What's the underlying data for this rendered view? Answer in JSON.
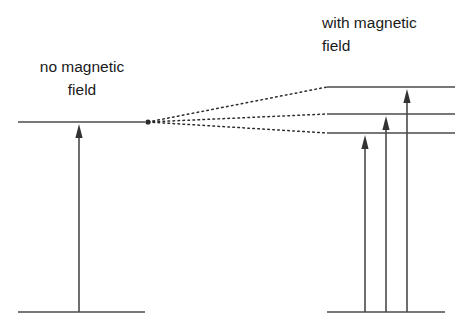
{
  "figure": {
    "background_color": "#ffffff",
    "line_color": "#4a4a4a",
    "dotted_color": "#2b2b2b",
    "text_color": "#1a1a1a",
    "width": 470,
    "height": 326
  },
  "labels": {
    "left": {
      "line1": "no magnetic",
      "line2": "field",
      "x": 82,
      "y1": 72,
      "y2": 95,
      "anchor": "middle"
    },
    "right": {
      "line1": "with magnetic",
      "line2": "field",
      "x": 322,
      "y1": 28,
      "y2": 51,
      "anchor": "start"
    }
  },
  "diagram_data": {
    "type": "energy-level",
    "left_panel": {
      "name": "no-magnetic-field",
      "excited_level": {
        "x1": 18,
        "x2": 145,
        "y": 122
      },
      "ground_level": {
        "x1": 18,
        "x2": 145,
        "y": 312
      },
      "transitions": [
        {
          "name": "single-transition",
          "x": 79,
          "y_from": 312,
          "y_to": 124
        }
      ]
    },
    "right_panel": {
      "name": "with-magnetic-field",
      "split_levels": [
        {
          "name": "upper-split-level",
          "x1": 327,
          "x2": 455,
          "y": 87
        },
        {
          "name": "middle-split-level",
          "x1": 327,
          "x2": 455,
          "y": 114
        },
        {
          "name": "lower-split-level",
          "x1": 327,
          "x2": 455,
          "y": 133
        }
      ],
      "ground_level": {
        "x1": 327,
        "x2": 445,
        "y": 312
      },
      "transitions": [
        {
          "name": "short-transition",
          "x": 365,
          "y_from": 312,
          "y_to": 135
        },
        {
          "name": "medium-transition",
          "x": 386,
          "y_from": 312,
          "y_to": 116
        },
        {
          "name": "long-transition",
          "x": 407,
          "y_from": 312,
          "y_to": 89
        }
      ]
    },
    "split_connectors": {
      "name": "level-splitting-connectors",
      "origin": {
        "x": 148,
        "y": 122
      },
      "endpoints": [
        {
          "x": 327,
          "y": 87
        },
        {
          "x": 327,
          "y": 114
        },
        {
          "x": 327,
          "y": 133
        }
      ]
    },
    "arrowhead": {
      "half_width": 3.6,
      "length": 14
    }
  }
}
